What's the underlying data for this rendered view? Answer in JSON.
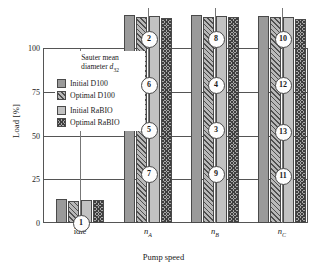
{
  "chart_data": {
    "type": "bar",
    "title": "",
    "xlabel": "Pump speed",
    "ylabel": "Load [%]",
    "ylim": [
      0,
      100
    ],
    "yticks": [
      0,
      25,
      50,
      75,
      100
    ],
    "grid": "horizontal",
    "legend_position": "inside-top-left",
    "legend_title": "Sauter mean diameter d̅₃₂",
    "categories": [
      "idle",
      "n_A",
      "n_B",
      "n_C"
    ],
    "category_labels": [
      "idle",
      "n",
      "n",
      "n"
    ],
    "category_subscripts": [
      "",
      "A",
      "B",
      "C"
    ],
    "series": [
      {
        "name": "Initial D100",
        "swatch": "sw-initial-d100",
        "color": "#9a9a9a"
      },
      {
        "name": "Optimal D100",
        "swatch": "sw-optimal-d100",
        "color": "#b9b9b9"
      },
      {
        "name": "Initial RaBIO",
        "swatch": "sw-initial-rabio",
        "color": "#c2c2c2"
      },
      {
        "name": "Optimal RaBIO",
        "swatch": "sw-optimal-rabio",
        "color": "#a8a8a8"
      }
    ],
    "operating_points": [
      {
        "id": "1",
        "category": "idle",
        "load": 13,
        "values": [
          13.5,
          12.5,
          13.0,
          13.0
        ]
      },
      {
        "id": "7",
        "category": "n_A",
        "load": 41,
        "values": [
          42.5,
          39.5,
          41.5,
          39.5
        ]
      },
      {
        "id": "5",
        "category": "n_A",
        "load": 66,
        "values": [
          67.5,
          66.5,
          67.0,
          66.0
        ]
      },
      {
        "id": "6",
        "category": "n_A",
        "load": 92,
        "values": [
          94.0,
          92.5,
          93.0,
          92.0
        ]
      },
      {
        "id": "2",
        "category": "n_A",
        "load": 118,
        "values": [
          119.0,
          118.0,
          118.5,
          117.0
        ]
      },
      {
        "id": "9",
        "category": "n_B",
        "load": 41,
        "values": [
          42.0,
          40.0,
          41.0,
          40.0
        ]
      },
      {
        "id": "3",
        "category": "n_B",
        "load": 66,
        "values": [
          67.0,
          66.5,
          67.0,
          66.0
        ]
      },
      {
        "id": "4",
        "category": "n_B",
        "load": 92,
        "values": [
          93.5,
          92.5,
          93.0,
          92.0
        ]
      },
      {
        "id": "8",
        "category": "n_B",
        "load": 118,
        "values": [
          119.0,
          118.0,
          118.5,
          117.5
        ]
      },
      {
        "id": "11",
        "category": "n_C",
        "load": 40,
        "values": [
          41.0,
          40.0,
          40.5,
          40.0
        ]
      },
      {
        "id": "13",
        "category": "n_C",
        "load": 65,
        "values": [
          66.5,
          65.5,
          66.5,
          65.0
        ]
      },
      {
        "id": "12",
        "category": "n_C",
        "load": 92,
        "values": [
          93.0,
          92.0,
          92.5,
          91.5
        ]
      },
      {
        "id": "10",
        "category": "n_C",
        "load": 118,
        "values": [
          118.5,
          117.5,
          118.0,
          116.5
        ]
      }
    ]
  },
  "axes": {
    "ylabel": "Load [%]",
    "xlabel": "Pump speed",
    "yticks": [
      "100",
      "75",
      "50",
      "25",
      "0"
    ],
    "xticks": [
      {
        "base": "idle",
        "sub": ""
      },
      {
        "base": "n",
        "sub": "A"
      },
      {
        "base": "n",
        "sub": "B"
      },
      {
        "base": "n",
        "sub": "C"
      }
    ]
  },
  "legend": {
    "title_line1": "Sauter mean",
    "title_line2_pre": "diameter ",
    "title_line2_var": "d",
    "title_line2_sub": "32",
    "items": [
      {
        "label": "Initial D100",
        "swatch": "sw-initial-d100"
      },
      {
        "label": "Optimal D100",
        "swatch": "sw-optimal-d100"
      },
      {
        "label": "Initial RaBIO",
        "swatch": "sw-initial-rabio"
      },
      {
        "label": "Optimal RaBIO",
        "swatch": "sw-optimal-rabio"
      }
    ]
  }
}
